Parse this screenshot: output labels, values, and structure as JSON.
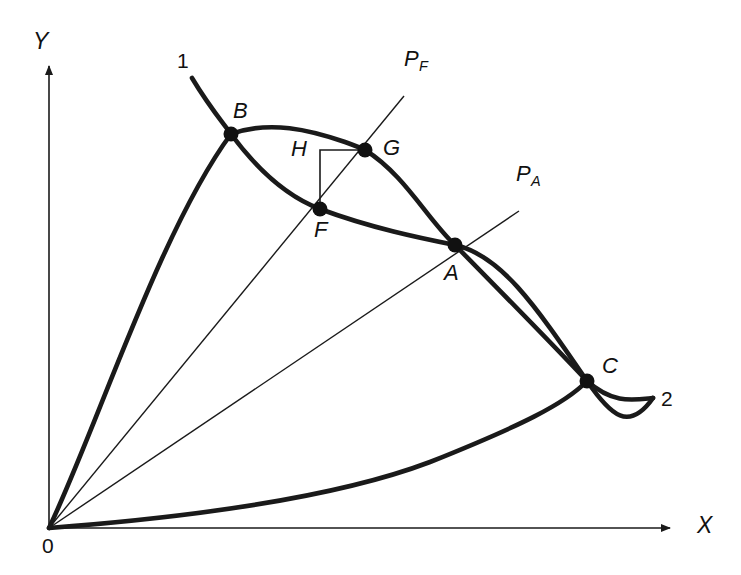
{
  "figure": {
    "type": "mathematical-diagram",
    "background_color": "#ffffff",
    "ink_color": "#1a1a1a",
    "width": 741,
    "height": 575
  },
  "axes": {
    "x_label": "X",
    "y_label": "Y",
    "origin_label": "0",
    "origin_px": [
      49,
      528
    ],
    "x_axis_from": [
      49,
      528
    ],
    "x_axis_to": [
      676,
      528
    ],
    "y_axis_from": [
      49,
      528
    ],
    "y_axis_to": [
      49,
      62
    ],
    "x_label_px": [
      697,
      514
    ],
    "y_label_px": [
      33,
      30
    ],
    "origin_label_px": [
      42,
      535
    ]
  },
  "curve_labels": [
    {
      "id": "curve-1",
      "text": "1",
      "px": [
        177,
        50
      ]
    },
    {
      "id": "curve-2",
      "text": "2",
      "px": [
        661,
        388
      ]
    }
  ],
  "rays": [
    {
      "id": "ray-pf",
      "label": "P",
      "subscript": "F",
      "from_px": [
        49,
        528
      ],
      "to_px": [
        404,
        96
      ],
      "label_px": [
        404,
        48
      ]
    },
    {
      "id": "ray-pa",
      "label": "P",
      "subscript": "A",
      "from_px": [
        49,
        528
      ],
      "to_px": [
        519,
        211
      ],
      "label_px": [
        516,
        163
      ]
    }
  ],
  "points": [
    {
      "id": "point-b",
      "label": "B",
      "px": [
        231,
        134
      ],
      "label_px": [
        233,
        100
      ]
    },
    {
      "id": "point-g",
      "label": "G",
      "px": [
        365,
        150
      ],
      "label_px": [
        383,
        137
      ]
    },
    {
      "id": "point-f",
      "label": "F",
      "px": [
        320,
        209
      ],
      "label_px": [
        314,
        219
      ]
    },
    {
      "id": "point-h",
      "label": "H",
      "px": [
        320,
        150
      ],
      "label_px": [
        291,
        138
      ]
    },
    {
      "id": "point-a",
      "label": "A",
      "px": [
        455,
        245
      ],
      "label_px": [
        444,
        262
      ]
    },
    {
      "id": "point-c",
      "label": "C",
      "px": [
        587,
        381
      ],
      "label_px": [
        602,
        355
      ]
    }
  ],
  "bracket": {
    "id": "right-angle-bracket-h",
    "corner_px": [
      320,
      150
    ],
    "vertical_to_px": [
      320,
      209
    ],
    "horizontal_to_px": [
      365,
      150
    ]
  },
  "curves": [
    {
      "id": "curve-one",
      "description": "Descending curve labelled 1, passes through B, F, A, C",
      "path": "M 192,78 C 210,108 224,124 231,134 C 262,176 291,198 320,209 C 371,228 420,238 455,245 C 500,255 533,302 587,381 C 611,416 629,432 653,398"
    },
    {
      "id": "curve-two",
      "description": "Rising curve from origin labelled 2, passes through B, G, A, C",
      "path": "M 49,528 C 96,430 160,230 231,134 C 270,120 310,130 345,142 C 356,146 361,148 365,150 C 404,174 428,220 455,245 C 497,288 539,330 587,381 C 613,404 632,400 653,398"
    },
    {
      "id": "curve-three",
      "description": "Lower curve from origin rising to the right and joining C",
      "path": "M 49,528 C 180,518 330,500 430,462 C 520,426 565,404 587,381"
    }
  ]
}
